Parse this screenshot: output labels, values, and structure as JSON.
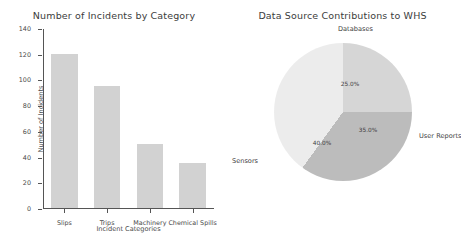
{
  "figure": {
    "background": "#ffffff",
    "width": 457,
    "height": 242
  },
  "chart_data": [
    {
      "type": "bar",
      "title": "Number of Incidents by Category",
      "xlabel": "Incident Categories",
      "ylabel": "Number of Incidents",
      "categories": [
        "Slips",
        "Trips",
        "Machinery",
        "Chemical Spills"
      ],
      "values": [
        120,
        95,
        50,
        35
      ],
      "ylim": [
        0,
        140
      ],
      "yticks": [
        0,
        20,
        40,
        60,
        80,
        100,
        120,
        140
      ],
      "grid": false,
      "legend": false,
      "bar_color": "#d2d2d2",
      "axis_color": "#555555",
      "text_color": "#4a4a4a"
    },
    {
      "type": "pie",
      "title": "Data Source Contributions to WHS",
      "labels": [
        "Databases",
        "User Reports",
        "Sensors"
      ],
      "values": [
        25.0,
        35.0,
        40.0
      ],
      "pct_labels": [
        "25.0%",
        "35.0%",
        "40.0%"
      ],
      "colors": [
        "#d6d6d6",
        "#bcbcbc",
        "#ececec"
      ],
      "startangle": 90,
      "counterclock": false,
      "legend": false,
      "label_positions": [
        {
          "name": "Databases",
          "name_x": 64,
          "name_y": -18,
          "pct_x": 76,
          "pct_y": 41
        },
        {
          "name": "User Reports",
          "name_x": 145,
          "name_y": 89,
          "pct_x": 94,
          "pct_y": 87
        },
        {
          "name": "Sensors",
          "name_x": -42,
          "name_y": 114,
          "pct_x": 48,
          "pct_y": 100
        }
      ]
    }
  ]
}
